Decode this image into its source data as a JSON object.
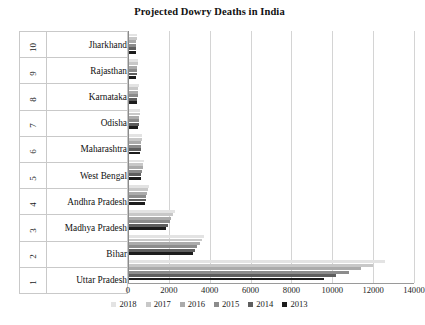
{
  "chart_data": {
    "type": "bar",
    "orientation": "horizontal",
    "title": "Projected Dowry Deaths in India",
    "xlabel": "",
    "ylabel": "",
    "xlim": [
      0,
      14000
    ],
    "xticks": [
      0,
      2000,
      4000,
      6000,
      8000,
      10000,
      12000,
      14000
    ],
    "grid": true,
    "legend_position": "bottom",
    "ranks": [
      "10",
      "9",
      "8",
      "7",
      "6",
      "5",
      "4",
      "3",
      "2",
      "1"
    ],
    "categories": [
      "Jharkhand",
      "Rajasthan",
      "Karnataka",
      "Odisha",
      "Maharashtra",
      "West Bengal",
      "Andhra Pradesh",
      "Madhya Pradesh",
      "Bihar",
      "Uttar Pradesh"
    ],
    "series": [
      {
        "name": "2018",
        "color": "#e3e3e3",
        "values": [
          430,
          480,
          520,
          600,
          700,
          760,
          1020,
          2280,
          3700,
          12600
        ]
      },
      {
        "name": "2017",
        "color": "#c8c8c8",
        "values": [
          420,
          470,
          505,
          580,
          680,
          735,
          980,
          2200,
          3600,
          12000
        ]
      },
      {
        "name": "2016",
        "color": "#ababab",
        "values": [
          410,
          455,
          490,
          560,
          660,
          710,
          940,
          2120,
          3500,
          11400
        ]
      },
      {
        "name": "2015",
        "color": "#8c8c8c",
        "values": [
          400,
          440,
          475,
          540,
          640,
          685,
          900,
          2040,
          3400,
          10800
        ]
      },
      {
        "name": "2014",
        "color": "#5e5e5e",
        "values": [
          390,
          425,
          460,
          520,
          620,
          660,
          860,
          1960,
          3300,
          10200
        ]
      },
      {
        "name": "2013",
        "color": "#1c1c1c",
        "values": [
          380,
          410,
          445,
          500,
          600,
          635,
          820,
          1880,
          3200,
          9600
        ]
      }
    ]
  }
}
